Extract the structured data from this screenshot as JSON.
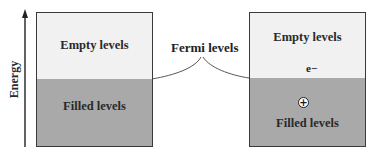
{
  "axis": {
    "label": "Energy"
  },
  "left_panel": {
    "empty_label": "Empty levels",
    "filled_label": "Filled levels"
  },
  "right_panel": {
    "empty_label": "Empty levels",
    "filled_label": "Filled levels",
    "electron_label": "e−",
    "hole_symbol": "+"
  },
  "annotation": {
    "fermi_label": "Fermi levels"
  },
  "colors": {
    "empty": "#f1f1f1",
    "filled": "#a9a9a9",
    "border": "#3a3a3a"
  }
}
